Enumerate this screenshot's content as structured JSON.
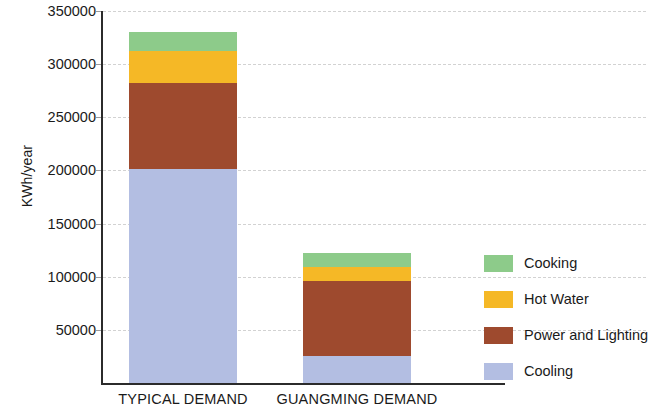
{
  "chart_data": {
    "type": "bar",
    "stacked": true,
    "title": "",
    "xlabel": "",
    "ylabel": "KWh/year",
    "categories": [
      "TYPICAL DEMAND",
      "GUANGMING DEMAND"
    ],
    "series": [
      {
        "name": "Cooling",
        "color": "#b3bee2",
        "values": [
          201000,
          25000
        ]
      },
      {
        "name": "Power and Lighting",
        "color": "#9e4a2e",
        "values": [
          81000,
          71000
        ]
      },
      {
        "name": "Hot Water",
        "color": "#f5b826",
        "values": [
          30500,
          13000
        ]
      },
      {
        "name": "Cooking",
        "color": "#8dcb8a",
        "values": [
          18200,
          13100
        ]
      }
    ],
    "totals": [
      330700,
      122100
    ],
    "ylim": [
      0,
      350000
    ],
    "yticks": [
      50000,
      100000,
      150000,
      200000,
      250000,
      300000,
      350000
    ],
    "ytick_labels": [
      "50000",
      "100000",
      "150000",
      "200000",
      "250000",
      "300000",
      "350000"
    ],
    "grid": true,
    "grid_style": "dashed",
    "grid_color": "#d2d2d2",
    "legend_position": "right",
    "legend_order": [
      "Cooking",
      "Hot Water",
      "Power and Lighting",
      "Cooling"
    ]
  },
  "axis": {
    "y_title": "KWh/year",
    "y_ticks": [
      {
        "label": "350000",
        "value": 350000
      },
      {
        "label": "300000",
        "value": 300000
      },
      {
        "label": "250000",
        "value": 250000
      },
      {
        "label": "200000",
        "value": 200000
      },
      {
        "label": "150000",
        "value": 150000
      },
      {
        "label": "100000",
        "value": 100000
      },
      {
        "label": "50000",
        "value": 50000
      }
    ],
    "x_ticks": [
      {
        "label": "TYPICAL DEMAND"
      },
      {
        "label": "GUANGMING DEMAND"
      }
    ]
  },
  "legend": {
    "items": [
      {
        "label": "Cooking",
        "color": "#8dcb8a"
      },
      {
        "label": "Hot Water",
        "color": "#f5b826"
      },
      {
        "label": "Power and Lighting",
        "color": "#9e4a2e"
      },
      {
        "label": "Cooling",
        "color": "#b3bee2"
      }
    ]
  },
  "colors": {
    "cooking": "#8dcb8a",
    "hot_water": "#f5b826",
    "power_and_lighting": "#9e4a2e",
    "cooling": "#b3bee2",
    "axis": "#2b2b2b",
    "grid": "#d2d2d2",
    "text": "#1a1a1a",
    "background": "#ffffff"
  }
}
